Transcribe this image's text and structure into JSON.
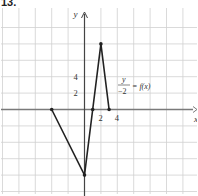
{
  "problem_number": "13.",
  "axes": {
    "x_label": "x",
    "y_label": "y",
    "x_ticks": [
      {
        "value": 2,
        "label": "2"
      },
      {
        "value": 4,
        "label": "4"
      }
    ],
    "y_ticks": [
      {
        "value": 2,
        "label": "2"
      },
      {
        "value": 4,
        "label": "4"
      }
    ],
    "grid_unit": 2,
    "x_range": [
      -10,
      14
    ],
    "y_range": [
      -10,
      12
    ]
  },
  "function_label": {
    "numerator": "y",
    "denominator": "−2",
    "rhs": "= f(x)"
  },
  "graph": {
    "points": [
      [
        -4,
        0
      ],
      [
        0,
        -8
      ],
      [
        1,
        0
      ],
      [
        2,
        8
      ],
      [
        3,
        0
      ]
    ],
    "line_color": "#222222",
    "grid_color": "#d0d0d0",
    "axis_color": "#7a7a7a"
  }
}
